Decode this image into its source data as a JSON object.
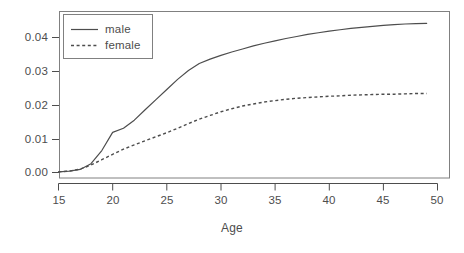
{
  "chart_data": {
    "type": "line",
    "title": "",
    "subtitle": "",
    "xlabel": "Age",
    "ylabel": "",
    "xlim": [
      14.2,
      50.9
    ],
    "ylim": [
      -0.0013,
      0.0455
    ],
    "grid": false,
    "legend_position": "top-left",
    "xticks": [
      15,
      20,
      25,
      30,
      35,
      40,
      45,
      50
    ],
    "xtick_labels": [
      "15",
      "20",
      "25",
      "30",
      "35",
      "40",
      "45",
      "50"
    ],
    "yticks": [
      0.0,
      0.01,
      0.02,
      0.03,
      0.04
    ],
    "ytick_labels": [
      "0.00",
      "0.01",
      "0.02",
      "0.03",
      "0.04"
    ],
    "x": [
      15,
      16,
      17,
      18,
      19,
      20,
      21,
      22,
      23,
      24,
      25,
      26,
      27,
      28,
      29,
      30,
      31,
      32,
      33,
      34,
      35,
      36,
      37,
      38,
      39,
      40,
      41,
      42,
      43,
      44,
      45,
      46,
      47,
      48,
      49
    ],
    "series": [
      {
        "name": "male",
        "style": "solid",
        "color": "#4d4d4d",
        "values": [
          0.0002,
          0.0004,
          0.0009,
          0.0026,
          0.0065,
          0.0119,
          0.0131,
          0.0155,
          0.0186,
          0.0216,
          0.0246,
          0.0276,
          0.0302,
          0.0323,
          0.0336,
          0.0347,
          0.0357,
          0.0366,
          0.0375,
          0.0383,
          0.039,
          0.0397,
          0.0403,
          0.0409,
          0.0414,
          0.0419,
          0.0423,
          0.0427,
          0.043,
          0.0433,
          0.0436,
          0.0438,
          0.044,
          0.0441,
          0.0442
        ]
      },
      {
        "name": "female",
        "style": "dashed",
        "color": "#4d4d4d",
        "values": [
          0.0002,
          0.0004,
          0.001,
          0.0022,
          0.0038,
          0.0054,
          0.0069,
          0.0082,
          0.0094,
          0.0106,
          0.0118,
          0.0131,
          0.0145,
          0.0158,
          0.0169,
          0.018,
          0.0189,
          0.0197,
          0.0203,
          0.0209,
          0.0213,
          0.0217,
          0.022,
          0.0222,
          0.0224,
          0.0226,
          0.0227,
          0.0229,
          0.023,
          0.0231,
          0.0232,
          0.0232,
          0.0233,
          0.0234,
          0.0234
        ]
      }
    ],
    "legend_entries": [
      {
        "label": "male",
        "style": "solid"
      },
      {
        "label": "female",
        "style": "dashed"
      }
    ]
  }
}
